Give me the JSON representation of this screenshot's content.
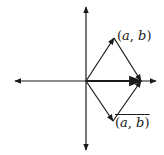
{
  "diagram": {
    "type": "complex-plane-vectors",
    "colors": {
      "ink": "#1a1a1a",
      "background": "#ffffff"
    },
    "axes": {
      "origin": [
        86,
        81
      ],
      "x_axis": {
        "from": [
          15,
          81
        ],
        "to": [
          156,
          81
        ],
        "arrows": "both"
      },
      "y_axis": {
        "from": [
          86,
          7
        ],
        "to": [
          86,
          150
        ],
        "arrows": "both"
      }
    },
    "points": {
      "z": [
        114,
        38
      ],
      "z_conj": [
        113,
        121
      ],
      "sum": [
        141,
        81
      ]
    },
    "vectors": [
      {
        "name": "z",
        "from": "origin",
        "to": "z"
      },
      {
        "name": "z-conj",
        "from": "origin",
        "to": "z_conj"
      },
      {
        "name": "sum",
        "from": "origin",
        "to": "sum"
      },
      {
        "name": "z-to-sum",
        "from": "z",
        "to": "sum"
      },
      {
        "name": "z-conj-to-sum",
        "from": "z_conj",
        "to": "sum"
      }
    ],
    "labels": {
      "z": {
        "text": "(a, b)",
        "open": "(",
        "a": "a",
        "sep": ", ",
        "b": "b",
        "close": ")"
      },
      "z_conj": {
        "text": "(a, b) with overline",
        "open": "(",
        "a": "a",
        "sep": ", ",
        "b": "b",
        "close": ")",
        "overline": true
      }
    }
  }
}
